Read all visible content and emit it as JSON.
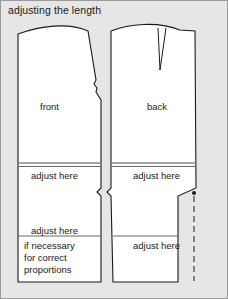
{
  "figure": {
    "title": "adjusting the length",
    "background_color": "#e6e6e6",
    "border_color": "#9a9a9a",
    "line_color": "#1a1a1a",
    "piece_fill": "#ffffff"
  },
  "pieces": {
    "front": {
      "name": "front",
      "labels": {
        "adjust_upper": "adjust here",
        "adjust_lower": "adjust here",
        "note_line1": "if necessary",
        "note_line2": "for correct",
        "note_line3": "proportions"
      }
    },
    "back": {
      "name": "back",
      "labels": {
        "adjust_upper": "adjust here",
        "adjust_lower": "adjust here"
      },
      "markings": {
        "dart": "waist-dart",
        "dot": "match-dot",
        "dashed_line": "grainline-dashed"
      }
    }
  }
}
